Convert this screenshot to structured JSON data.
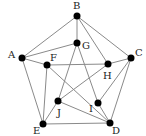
{
  "graph": {
    "nodes": [
      {
        "id": "A",
        "x": 22,
        "y": 58,
        "lx": 8,
        "ly": 58
      },
      {
        "id": "B",
        "x": 77,
        "y": 16,
        "lx": 73,
        "ly": 9
      },
      {
        "id": "C",
        "x": 131,
        "y": 58,
        "lx": 135,
        "ly": 56
      },
      {
        "id": "D",
        "x": 110,
        "y": 123,
        "lx": 112,
        "ly": 134
      },
      {
        "id": "E",
        "x": 43,
        "y": 124,
        "lx": 33,
        "ly": 134
      },
      {
        "id": "F",
        "x": 47,
        "y": 65,
        "lx": 50,
        "ly": 61
      },
      {
        "id": "G",
        "x": 77,
        "y": 43,
        "lx": 82,
        "ly": 49
      },
      {
        "id": "H",
        "x": 108,
        "y": 64,
        "lx": 103,
        "ly": 79
      },
      {
        "id": "I",
        "x": 98,
        "y": 103,
        "lx": 89,
        "ly": 112
      },
      {
        "id": "J",
        "x": 58,
        "y": 101,
        "lx": 57,
        "ly": 116
      }
    ],
    "edges": [
      [
        "A",
        "B"
      ],
      [
        "A",
        "G"
      ],
      [
        "A",
        "F"
      ],
      [
        "A",
        "E"
      ],
      [
        "B",
        "G"
      ],
      [
        "B",
        "H"
      ],
      [
        "B",
        "C"
      ],
      [
        "C",
        "H"
      ],
      [
        "C",
        "I"
      ],
      [
        "C",
        "D"
      ],
      [
        "D",
        "E"
      ],
      [
        "D",
        "J"
      ],
      [
        "D",
        "I"
      ],
      [
        "D",
        "F"
      ],
      [
        "E",
        "F"
      ],
      [
        "E",
        "J"
      ],
      [
        "F",
        "H"
      ],
      [
        "G",
        "J"
      ],
      [
        "G",
        "I"
      ],
      [
        "H",
        "J"
      ]
    ]
  }
}
